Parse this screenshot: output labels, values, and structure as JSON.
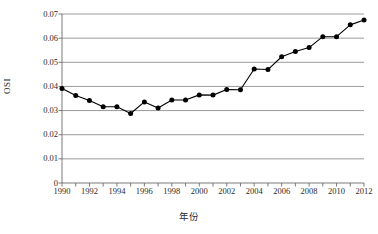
{
  "chart_data": {
    "type": "line",
    "title": "",
    "xlabel": "年份",
    "ylabel": "OSI",
    "xlim": [
      1990,
      2012
    ],
    "ylim": [
      0,
      0.07
    ],
    "grid": true,
    "legend": "none",
    "marker": "filled-circle",
    "y_ticks": [
      "0",
      "0.01",
      "0.02",
      "0.03",
      "0.04",
      "0.05",
      "0.06",
      "0.07"
    ],
    "y_tick_values": [
      0,
      0.01,
      0.02,
      0.03,
      0.04,
      0.05,
      0.06,
      0.07
    ],
    "x_ticks": [
      "1990",
      "1992",
      "1994",
      "1996",
      "1998",
      "2000",
      "2002",
      "2004",
      "2006",
      "2008",
      "2010",
      "2012"
    ],
    "x_tick_values": [
      1990,
      1992,
      1994,
      1996,
      1998,
      2000,
      2002,
      2004,
      2006,
      2008,
      2010,
      2012
    ],
    "x": [
      1990,
      1991,
      1992,
      1993,
      1994,
      1995,
      1996,
      1997,
      1998,
      1999,
      2000,
      2001,
      2002,
      2003,
      2004,
      2005,
      2006,
      2007,
      2008,
      2009,
      2010,
      2011,
      2012
    ],
    "series": [
      {
        "name": "OSI",
        "color": "#000000",
        "values": [
          0.0391,
          0.0362,
          0.0342,
          0.0316,
          0.0316,
          0.0288,
          0.0336,
          0.0311,
          0.0344,
          0.0344,
          0.0365,
          0.0364,
          0.0387,
          0.0386,
          0.0472,
          0.047,
          0.0523,
          0.0545,
          0.0561,
          0.0606,
          0.0606,
          0.0655,
          0.0675
        ]
      }
    ]
  },
  "axis": {
    "y_title": "OSI",
    "x_title": "年份"
  },
  "colors": {
    "line": "#1a1a1a",
    "marker": "#000000",
    "grid": "#808080",
    "frame": "#6b6b6b",
    "background": "#ffffff"
  }
}
